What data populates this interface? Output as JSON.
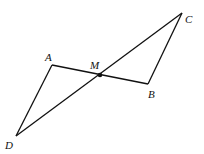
{
  "diagram": {
    "stroke_color": "#111111",
    "points": {
      "A": {
        "label": "A",
        "x": 52,
        "y": 65
      },
      "M": {
        "label": "M",
        "x": 100,
        "y": 75
      },
      "B": {
        "label": "B",
        "x": 148,
        "y": 84
      },
      "C": {
        "label": "C",
        "x": 182,
        "y": 13
      },
      "D": {
        "label": "D",
        "x": 16,
        "y": 136
      }
    },
    "segments": [
      "AB",
      "CD",
      "AD",
      "BC"
    ],
    "labels": {
      "A": "A",
      "M": "M",
      "B": "B",
      "C": "C",
      "D": "D"
    }
  }
}
